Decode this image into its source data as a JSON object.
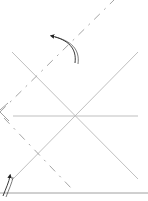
{
  "diagram": {
    "type": "origami-fold-diagram",
    "colors": {
      "background": "#ffffff",
      "crease": "#b8b8b8",
      "fold_line": "#9a9a9a",
      "edge": "#a0a0a0",
      "arrow": "#222222"
    },
    "creases": [
      {
        "name": "diagonal-crease-a",
        "x1": 12,
        "y1": 52,
        "x2": 138,
        "y2": 179
      },
      {
        "name": "diagonal-crease-b",
        "x1": 12,
        "y1": 180,
        "x2": 138,
        "y2": 52
      },
      {
        "name": "horizontal-crease",
        "x1": 13,
        "y1": 116,
        "x2": 138,
        "y2": 116
      }
    ],
    "valley_fold_lines": [
      {
        "name": "valley-fold-upper",
        "x1": 0,
        "y1": 112,
        "x2": 114,
        "y2": 0
      },
      {
        "name": "valley-fold-lower",
        "x1": 4,
        "y1": 118,
        "x2": 72,
        "y2": 189
      }
    ],
    "paper_edges": [
      {
        "name": "bottom-edge",
        "x1": 0,
        "y1": 193,
        "x2": 148,
        "y2": 193
      },
      {
        "name": "left-corner-edge-a",
        "x1": 0,
        "y1": 110,
        "x2": 8,
        "y2": 103
      },
      {
        "name": "left-corner-edge-b",
        "x1": 0,
        "y1": 112,
        "x2": 9,
        "y2": 121
      }
    ],
    "arrows": [
      {
        "name": "fold-arrow-upper",
        "type": "curved",
        "d": "M75,63 C77,48 68,40 52,36",
        "head": {
          "x": 52,
          "y": 36
        }
      },
      {
        "name": "fold-arrow-lower",
        "type": "curved",
        "d": "M3,196 C6,188 9,182 10,176",
        "head": {
          "x": 10,
          "y": 174
        }
      }
    ]
  }
}
